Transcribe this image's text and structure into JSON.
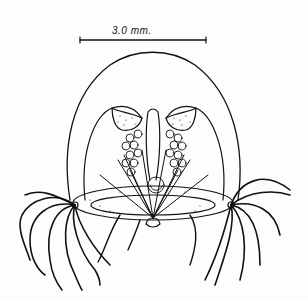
{
  "figure": {
    "scale_bar": {
      "label": "3.0   mm.",
      "value": 3.0,
      "unit": "mm."
    },
    "colors": {
      "ink": "#111111",
      "paper": "#fdfdfd"
    }
  }
}
